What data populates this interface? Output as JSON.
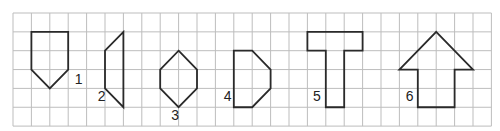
{
  "grid": {
    "cols": 26,
    "rows": 6,
    "origin_x": 13,
    "origin_y": 13,
    "cell_w": 18.4,
    "cell_h": 18.85,
    "line_color": "#bdbdbd"
  },
  "shapes": [
    {
      "label": "1",
      "points": [
        [
          1,
          1
        ],
        [
          3,
          1
        ],
        [
          3,
          3
        ],
        [
          2,
          4
        ],
        [
          1,
          3
        ]
      ],
      "label_pos": [
        3.35,
        3.75
      ]
    },
    {
      "label": "2",
      "points": [
        [
          6,
          1
        ],
        [
          6,
          5
        ],
        [
          5,
          4
        ],
        [
          5,
          2
        ]
      ],
      "label_pos": [
        4.6,
        4.65
      ]
    },
    {
      "label": "3",
      "points": [
        [
          9,
          2
        ],
        [
          10,
          3
        ],
        [
          10,
          4
        ],
        [
          9,
          5
        ],
        [
          8,
          4
        ],
        [
          8,
          3
        ]
      ],
      "label_pos": [
        8.6,
        5.65
      ]
    },
    {
      "label": "4",
      "points": [
        [
          12,
          2
        ],
        [
          13,
          2
        ],
        [
          14,
          3
        ],
        [
          14,
          4
        ],
        [
          13,
          5
        ],
        [
          12,
          5
        ]
      ],
      "label_pos": [
        11.45,
        4.65
      ]
    },
    {
      "label": "5",
      "points": [
        [
          16,
          1
        ],
        [
          19,
          1
        ],
        [
          19,
          2
        ],
        [
          18,
          2
        ],
        [
          18,
          5
        ],
        [
          17,
          5
        ],
        [
          17,
          2
        ],
        [
          16,
          2
        ]
      ],
      "label_pos": [
        16.3,
        4.65
      ]
    },
    {
      "label": "6",
      "points": [
        [
          23,
          1
        ],
        [
          25,
          3
        ],
        [
          24,
          3
        ],
        [
          24,
          5
        ],
        [
          22,
          5
        ],
        [
          22,
          3
        ],
        [
          21,
          3
        ]
      ],
      "label_pos": [
        21.35,
        4.65
      ]
    }
  ]
}
